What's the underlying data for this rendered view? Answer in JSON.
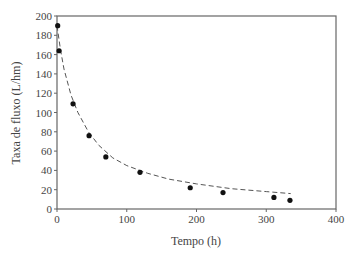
{
  "chart_data": {
    "type": "scatter",
    "title": "",
    "xlabel": "Tempo (h)",
    "ylabel": "Taxa de fluxo (L/hm)",
    "xlim": [
      0,
      400
    ],
    "ylim": [
      0,
      200
    ],
    "xticks": [
      0,
      100,
      200,
      300,
      400
    ],
    "yticks": [
      0,
      20,
      40,
      60,
      80,
      100,
      120,
      140,
      160,
      180,
      200
    ],
    "grid": false,
    "legend": null,
    "series": [
      {
        "name": "Dados medidos",
        "style": "markers",
        "x": [
          1,
          3,
          23,
          46,
          70,
          119,
          191,
          238,
          311,
          334
        ],
        "y": [
          190,
          164,
          109,
          76,
          54,
          38,
          22,
          17,
          12,
          9
        ]
      },
      {
        "name": "Ajuste",
        "style": "dashed-line",
        "x": [
          0,
          5,
          10,
          20,
          30,
          45,
          60,
          80,
          100,
          130,
          160,
          200,
          250,
          300,
          335
        ],
        "y": [
          190,
          165,
          145,
          118,
          100,
          80,
          66,
          53,
          45,
          37,
          31,
          26,
          21,
          18,
          16
        ]
      }
    ]
  }
}
